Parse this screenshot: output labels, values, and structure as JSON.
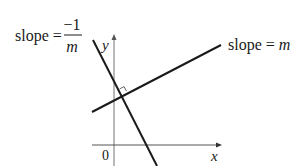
{
  "diagram": {
    "type": "perpendicular-lines",
    "colors": {
      "ink": "#1a1a1a",
      "axis": "#7a7a7a",
      "background": "#ffffff"
    },
    "axes": {
      "x_label": "x",
      "y_label": "y",
      "origin_label": "0"
    },
    "lines": [
      {
        "id": "line-m",
        "label_prefix": "slope = ",
        "label_var": "m"
      },
      {
        "id": "line-perp",
        "label_prefix": "slope = ",
        "numerator": "−1",
        "denominator": "m"
      }
    ],
    "right_angle_marker": true
  }
}
